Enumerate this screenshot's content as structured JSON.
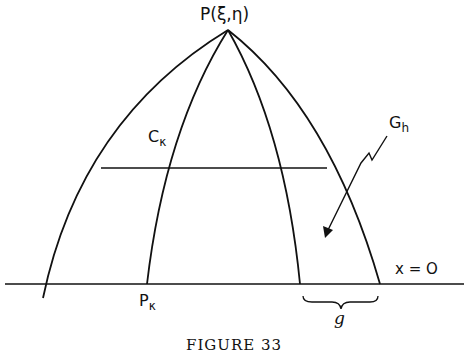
{
  "diagram": {
    "apex_label": "P(ξ,η)",
    "labels": {
      "c_k": {
        "main": "C",
        "sub": "κ"
      },
      "g_h": {
        "main": "G",
        "sub": "h"
      },
      "p_k": {
        "main": "P",
        "sub": "κ"
      },
      "axis": "x = O",
      "brace": "g"
    },
    "caption": "FIGURE 33",
    "colors": {
      "stroke": "#111111",
      "background": "#ffffff"
    }
  }
}
